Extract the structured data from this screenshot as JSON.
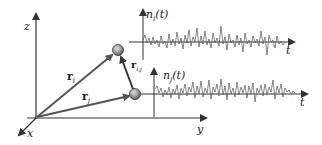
{
  "figure": {
    "axes3d": {
      "z_label": "z",
      "y_label": "y",
      "x_label": "x"
    },
    "vectors": {
      "r_i": {
        "base": "r",
        "sub": "i"
      },
      "r_j": {
        "base": "r",
        "sub": "j"
      },
      "r_ij": {
        "base": "r",
        "sub": "i,j"
      }
    },
    "particles": [
      {
        "name": "particle-i",
        "cx": 118,
        "cy": 50
      },
      {
        "name": "particle-j",
        "cx": 135,
        "cy": 95
      }
    ],
    "signals": {
      "top": {
        "label_base": "n",
        "label_sub": "i",
        "label_arg": "(t)",
        "t_label": "t"
      },
      "bottom": {
        "label_base": "n",
        "label_sub": "j",
        "label_arg": "(t)",
        "t_label": "t"
      }
    },
    "colors": {
      "line": "#333333",
      "vector": "#555555",
      "particle_fill": "#9a9a9a",
      "noise": "#555555"
    }
  }
}
